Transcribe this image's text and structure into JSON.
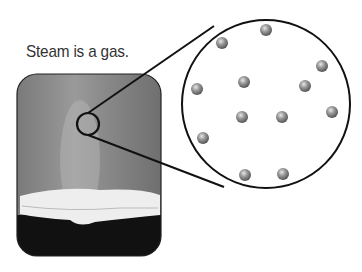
{
  "caption": "Steam is a gas.",
  "photo": {
    "subject": "steam rising from a pot",
    "x": 17,
    "y": 74,
    "w": 144,
    "h": 182,
    "r": 20
  },
  "magnifier": {
    "small": {
      "cx": 88,
      "cy": 124,
      "r": 11
    },
    "large": {
      "cx": 266,
      "cy": 104,
      "r": 84
    }
  },
  "particles": [
    [
      266,
      30
    ],
    [
      222,
      43
    ],
    [
      322,
      66
    ],
    [
      244,
      82
    ],
    [
      305,
      86
    ],
    [
      197,
      89
    ],
    [
      242,
      117
    ],
    [
      282,
      117
    ],
    [
      332,
      112
    ],
    [
      203,
      138
    ],
    [
      245,
      175
    ],
    [
      283,
      174
    ]
  ],
  "colors": {
    "outline": "#111111",
    "particle": "#888888"
  }
}
